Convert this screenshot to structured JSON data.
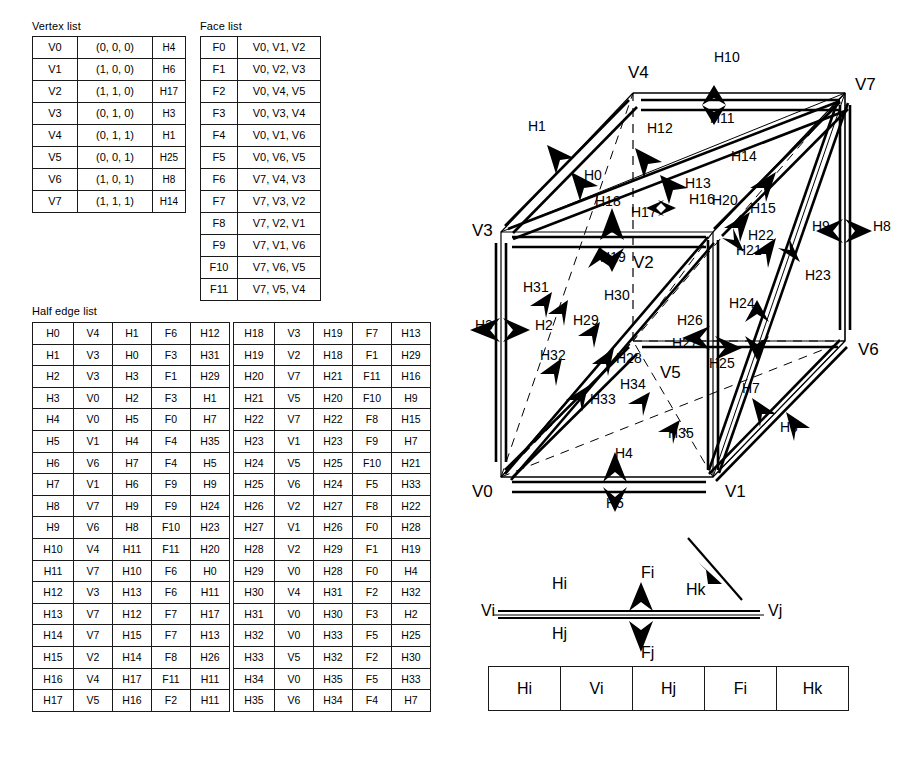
{
  "titles": {
    "vertex_list": "Vertex list",
    "face_list": "Face list",
    "half_edge_list": "Half edge list"
  },
  "vertex_list": {
    "rows": [
      {
        "id": "V0",
        "coord": "(0, 0, 0)",
        "halfedge": "H4"
      },
      {
        "id": "V1",
        "coord": "(1, 0, 0)",
        "halfedge": "H6"
      },
      {
        "id": "V2",
        "coord": "(1, 1, 0)",
        "halfedge": "H17"
      },
      {
        "id": "V3",
        "coord": "(0, 1, 0)",
        "halfedge": "H3"
      },
      {
        "id": "V4",
        "coord": "(0, 1, 1)",
        "halfedge": "H1"
      },
      {
        "id": "V5",
        "coord": "(0, 0, 1)",
        "halfedge": "H25"
      },
      {
        "id": "V6",
        "coord": "(1, 0, 1)",
        "halfedge": "H8"
      },
      {
        "id": "V7",
        "coord": "(1, 1, 1)",
        "halfedge": "H14"
      }
    ]
  },
  "face_list": {
    "rows": [
      {
        "id": "F0",
        "verts": "V0, V1, V2"
      },
      {
        "id": "F1",
        "verts": "V0, V2, V3"
      },
      {
        "id": "F2",
        "verts": "V0, V4, V5"
      },
      {
        "id": "F3",
        "verts": "V0, V3, V4"
      },
      {
        "id": "F4",
        "verts": "V0, V1, V6"
      },
      {
        "id": "F5",
        "verts": "V0, V6, V5"
      },
      {
        "id": "F6",
        "verts": "V7, V4, V3"
      },
      {
        "id": "F7",
        "verts": "V7, V3, V2"
      },
      {
        "id": "F8",
        "verts": "V7, V2, V1"
      },
      {
        "id": "F9",
        "verts": "V7, V1, V6"
      },
      {
        "id": "F10",
        "verts": "V7, V6, V5"
      },
      {
        "id": "F11",
        "verts": "V7, V5, V4"
      }
    ]
  },
  "half_edge_list": {
    "left_rows": [
      {
        "id": "H0",
        "vertex": "V4",
        "opposite": "H1",
        "face": "F6",
        "next": "H12"
      },
      {
        "id": "H1",
        "vertex": "V3",
        "opposite": "H0",
        "face": "F3",
        "next": "H31"
      },
      {
        "id": "H2",
        "vertex": "V3",
        "opposite": "H3",
        "face": "F1",
        "next": "H29"
      },
      {
        "id": "H3",
        "vertex": "V0",
        "opposite": "H2",
        "face": "F3",
        "next": "H1"
      },
      {
        "id": "H4",
        "vertex": "V0",
        "opposite": "H5",
        "face": "F0",
        "next": "H7"
      },
      {
        "id": "H5",
        "vertex": "V1",
        "opposite": "H4",
        "face": "F4",
        "next": "H35"
      },
      {
        "id": "H6",
        "vertex": "V6",
        "opposite": "H7",
        "face": "F4",
        "next": "H5"
      },
      {
        "id": "H7",
        "vertex": "V1",
        "opposite": "H6",
        "face": "F9",
        "next": "H9"
      },
      {
        "id": "H8",
        "vertex": "V7",
        "opposite": "H9",
        "face": "F9",
        "next": "H24"
      },
      {
        "id": "H9",
        "vertex": "V6",
        "opposite": "H8",
        "face": "F10",
        "next": "H23"
      },
      {
        "id": "H10",
        "vertex": "V4",
        "opposite": "H11",
        "face": "F11",
        "next": "H20"
      },
      {
        "id": "H11",
        "vertex": "V7",
        "opposite": "H10",
        "face": "F6",
        "next": "H0"
      },
      {
        "id": "H12",
        "vertex": "V3",
        "opposite": "H13",
        "face": "F6",
        "next": "H11"
      },
      {
        "id": "H13",
        "vertex": "V7",
        "opposite": "H12",
        "face": "F7",
        "next": "H17"
      },
      {
        "id": "H14",
        "vertex": "V7",
        "opposite": "H15",
        "face": "F7",
        "next": "H13"
      },
      {
        "id": "H15",
        "vertex": "V2",
        "opposite": "H14",
        "face": "F8",
        "next": "H26"
      },
      {
        "id": "H16",
        "vertex": "V4",
        "opposite": "H17",
        "face": "F11",
        "next": "H11"
      },
      {
        "id": "H17",
        "vertex": "V5",
        "opposite": "H16",
        "face": "F2",
        "next": "H11"
      }
    ],
    "right_rows": [
      {
        "id": "H18",
        "vertex": "V3",
        "opposite": "H19",
        "face": "F7",
        "next": "H13"
      },
      {
        "id": "H19",
        "vertex": "V2",
        "opposite": "H18",
        "face": "F1",
        "next": "H29"
      },
      {
        "id": "H20",
        "vertex": "V7",
        "opposite": "H21",
        "face": "F11",
        "next": "H16"
      },
      {
        "id": "H21",
        "vertex": "V5",
        "opposite": "H20",
        "face": "F10",
        "next": "H9"
      },
      {
        "id": "H22",
        "vertex": "V7",
        "opposite": "H22",
        "face": "F8",
        "next": "H15"
      },
      {
        "id": "H23",
        "vertex": "V1",
        "opposite": "H23",
        "face": "F9",
        "next": "H7"
      },
      {
        "id": "H24",
        "vertex": "V5",
        "opposite": "H25",
        "face": "F10",
        "next": "H21"
      },
      {
        "id": "H25",
        "vertex": "V6",
        "opposite": "H24",
        "face": "F5",
        "next": "H33"
      },
      {
        "id": "H26",
        "vertex": "V2",
        "opposite": "H27",
        "face": "F8",
        "next": "H22"
      },
      {
        "id": "H27",
        "vertex": "V1",
        "opposite": "H26",
        "face": "F0",
        "next": "H28"
      },
      {
        "id": "H28",
        "vertex": "V2",
        "opposite": "H29",
        "face": "F1",
        "next": "H19"
      },
      {
        "id": "H29",
        "vertex": "V0",
        "opposite": "H28",
        "face": "F0",
        "next": "H4"
      },
      {
        "id": "H30",
        "vertex": "V4",
        "opposite": "H31",
        "face": "F2",
        "next": "H32"
      },
      {
        "id": "H31",
        "vertex": "V0",
        "opposite": "H30",
        "face": "F3",
        "next": "H2"
      },
      {
        "id": "H32",
        "vertex": "V0",
        "opposite": "H33",
        "face": "F5",
        "next": "H25"
      },
      {
        "id": "H33",
        "vertex": "V5",
        "opposite": "H32",
        "face": "F2",
        "next": "H30"
      },
      {
        "id": "H34",
        "vertex": "V0",
        "opposite": "H35",
        "face": "F5",
        "next": "H33"
      },
      {
        "id": "H35",
        "vertex": "V6",
        "opposite": "H34",
        "face": "F4",
        "next": "H7"
      }
    ]
  },
  "cube_diagram": {
    "vertex_labels": [
      {
        "text": "V4",
        "x": 628,
        "y": 78
      },
      {
        "text": "V7",
        "x": 855,
        "y": 90
      },
      {
        "text": "V3",
        "x": 472,
        "y": 236
      },
      {
        "text": "V2",
        "x": 633,
        "y": 268
      },
      {
        "text": "V6",
        "x": 858,
        "y": 355
      },
      {
        "text": "V5",
        "x": 660,
        "y": 378
      },
      {
        "text": "V0",
        "x": 472,
        "y": 497
      },
      {
        "text": "V1",
        "x": 725,
        "y": 497
      }
    ],
    "halfedge_labels": [
      {
        "text": "H10",
        "x": 714,
        "y": 62
      },
      {
        "text": "H1",
        "x": 528,
        "y": 131
      },
      {
        "text": "H12",
        "x": 647,
        "y": 133
      },
      {
        "text": "H11",
        "x": 710,
        "y": 123
      },
      {
        "text": "H14",
        "x": 731,
        "y": 161
      },
      {
        "text": "H0",
        "x": 584,
        "y": 180
      },
      {
        "text": "H13",
        "x": 685,
        "y": 188
      },
      {
        "text": "H16",
        "x": 689,
        "y": 204
      },
      {
        "text": "H20",
        "x": 712,
        "y": 205
      },
      {
        "text": "H18",
        "x": 595,
        "y": 206
      },
      {
        "text": "H17",
        "x": 631,
        "y": 217
      },
      {
        "text": "H15",
        "x": 750,
        "y": 213
      },
      {
        "text": "H9",
        "x": 812,
        "y": 231
      },
      {
        "text": "H8",
        "x": 873,
        "y": 231
      },
      {
        "text": "H22",
        "x": 748,
        "y": 240
      },
      {
        "text": "H21",
        "x": 736,
        "y": 255
      },
      {
        "text": "H19",
        "x": 600,
        "y": 262
      },
      {
        "text": "H23",
        "x": 805,
        "y": 280
      },
      {
        "text": "H31",
        "x": 523,
        "y": 292
      },
      {
        "text": "H30",
        "x": 604,
        "y": 300
      },
      {
        "text": "H24",
        "x": 729,
        "y": 308
      },
      {
        "text": "H3",
        "x": 475,
        "y": 330
      },
      {
        "text": "H2",
        "x": 535,
        "y": 330
      },
      {
        "text": "H29",
        "x": 573,
        "y": 325
      },
      {
        "text": "H26",
        "x": 677,
        "y": 325
      },
      {
        "text": "H27",
        "x": 672,
        "y": 348
      },
      {
        "text": "H32",
        "x": 540,
        "y": 360
      },
      {
        "text": "H28",
        "x": 616,
        "y": 363
      },
      {
        "text": "H25",
        "x": 709,
        "y": 368
      },
      {
        "text": "H7",
        "x": 742,
        "y": 393
      },
      {
        "text": "H34",
        "x": 620,
        "y": 389
      },
      {
        "text": "H33",
        "x": 590,
        "y": 404
      },
      {
        "text": "H35",
        "x": 668,
        "y": 438
      },
      {
        "text": "H6",
        "x": 780,
        "y": 432
      },
      {
        "text": "H4",
        "x": 615,
        "y": 458
      },
      {
        "text": "H5",
        "x": 606,
        "y": 508
      }
    ]
  },
  "legend_diagram": {
    "labels": [
      {
        "text": "Vi",
        "x": 481,
        "y": 616
      },
      {
        "text": "Vj",
        "x": 768,
        "y": 616
      },
      {
        "text": "Hi",
        "x": 552,
        "y": 589
      },
      {
        "text": "Hk",
        "x": 686,
        "y": 595
      },
      {
        "text": "Fi",
        "x": 641,
        "y": 578
      },
      {
        "text": "Hj",
        "x": 552,
        "y": 639
      },
      {
        "text": "Fj",
        "x": 641,
        "y": 658
      }
    ]
  },
  "legend_table": {
    "cells": [
      "Hi",
      "Vi",
      "Hj",
      "Fi",
      "Hk"
    ]
  },
  "colors": {
    "ink": "#000000",
    "rule": "#1a1a1a",
    "background": "#ffffff"
  }
}
